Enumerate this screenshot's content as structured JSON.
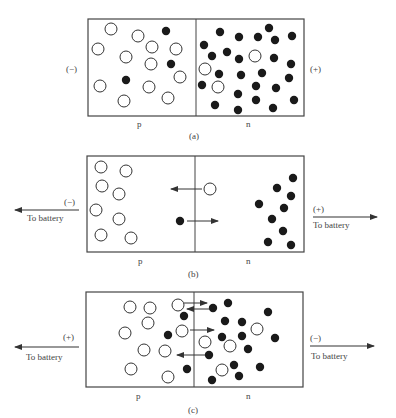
{
  "figure": {
    "colors": {
      "stroke": "#444444",
      "electron": "#1a1a1a",
      "hole_fill": "#ffffff"
    },
    "panels": [
      {
        "id": "a",
        "caption": "(a)",
        "left_region_label": "p",
        "right_region_label": "n",
        "left_terminal": "(−)",
        "right_terminal": "(+)",
        "left_battery_label": "",
        "right_battery_label": "",
        "box": {
          "x": 88,
          "y": 19,
          "w": 216,
          "h": 97,
          "divider_x": 196
        },
        "holes": [
          [
            111,
            29
          ],
          [
            138,
            36
          ],
          [
            98,
            49
          ],
          [
            126,
            57
          ],
          [
            152,
            47
          ],
          [
            176,
            49
          ],
          [
            151,
            64
          ],
          [
            180,
            77
          ],
          [
            100,
            86
          ],
          [
            149,
            87
          ],
          [
            124,
            101
          ],
          [
            168,
            98
          ],
          [
            255,
            56
          ],
          [
            205,
            69
          ],
          [
            218,
            87
          ]
        ],
        "electrons": [
          [
            166,
            31
          ],
          [
            171,
            64
          ],
          [
            126,
            80
          ],
          [
            220,
            32
          ],
          [
            239,
            37
          ],
          [
            258,
            37
          ],
          [
            269,
            28
          ],
          [
            275,
            40
          ],
          [
            292,
            36
          ],
          [
            204,
            45
          ],
          [
            212,
            56
          ],
          [
            227,
            52
          ],
          [
            239,
            59
          ],
          [
            274,
            58
          ],
          [
            291,
            64
          ],
          [
            219,
            74
          ],
          [
            241,
            75
          ],
          [
            262,
            73
          ],
          [
            289,
            78
          ],
          [
            202,
            85
          ],
          [
            256,
            86
          ],
          [
            276,
            88
          ],
          [
            238,
            94
          ],
          [
            256,
            100
          ],
          [
            294,
            100
          ],
          [
            215,
            105
          ],
          [
            238,
            110
          ],
          [
            273,
            108
          ]
        ],
        "arrows": [],
        "battery_arrows": []
      },
      {
        "id": "b",
        "caption": "(b)",
        "left_region_label": "p",
        "right_region_label": "n",
        "left_terminal": "(−)",
        "right_terminal": "(+)",
        "left_battery_label": "To battery",
        "right_battery_label": "To battery",
        "box": {
          "x": 87,
          "y": 156,
          "w": 217,
          "h": 96,
          "divider_x": 195
        },
        "holes": [
          [
            101,
            167
          ],
          [
            126,
            171
          ],
          [
            102,
            186
          ],
          [
            119,
            194
          ],
          [
            96,
            210
          ],
          [
            119,
            219
          ],
          [
            101,
            235
          ],
          [
            131,
            238
          ],
          [
            210,
            189
          ]
        ],
        "electrons": [
          [
            180,
            221
          ],
          [
            293,
            178
          ],
          [
            277,
            188
          ],
          [
            291,
            196
          ],
          [
            259,
            204
          ],
          [
            284,
            208
          ],
          [
            272,
            219
          ],
          [
            283,
            231
          ],
          [
            268,
            242
          ],
          [
            291,
            245
          ]
        ],
        "arrows": [
          [
            202,
            189,
            171,
            189
          ],
          [
            187,
            221,
            218,
            221
          ]
        ],
        "battery_arrows": [
          [
            79,
            210,
            15,
            210
          ],
          [
            313,
            217,
            377,
            217
          ]
        ]
      },
      {
        "id": "c",
        "caption": "(c)",
        "left_region_label": "p",
        "right_region_label": "n",
        "left_terminal": "(+)",
        "right_terminal": "(−)",
        "left_battery_label": "To battery",
        "right_battery_label": "To battery",
        "box": {
          "x": 86,
          "y": 292,
          "w": 217,
          "h": 95,
          "divider_x": 194
        },
        "holes": [
          [
            130,
            307
          ],
          [
            150,
            308
          ],
          [
            178,
            305
          ],
          [
            148,
            323
          ],
          [
            125,
            333
          ],
          [
            182,
            331
          ],
          [
            144,
            350
          ],
          [
            165,
            351
          ],
          [
            131,
            369
          ],
          [
            168,
            377
          ],
          [
            257,
            329
          ],
          [
            205,
            342
          ],
          [
            230,
            346
          ],
          [
            222,
            370
          ]
        ],
        "electrons": [
          [
            184,
            316
          ],
          [
            168,
            335
          ],
          [
            187,
            369
          ],
          [
            213,
            308
          ],
          [
            228,
            303
          ],
          [
            268,
            312
          ],
          [
            225,
            321
          ],
          [
            242,
            322
          ],
          [
            222,
            337
          ],
          [
            242,
            336
          ],
          [
            275,
            338
          ],
          [
            248,
            349
          ],
          [
            209,
            355
          ],
          [
            234,
            365
          ],
          [
            260,
            367
          ],
          [
            239,
            376
          ],
          [
            212,
            380
          ]
        ],
        "arrows": [
          [
            184,
            303,
            207,
            303
          ],
          [
            210,
            309,
            187,
            309
          ],
          [
            190,
            330,
            214,
            330
          ],
          [
            205,
            355,
            177,
            355
          ]
        ],
        "battery_arrows": [
          [
            79,
            347,
            15,
            347
          ],
          [
            310,
            346,
            374,
            346
          ]
        ]
      }
    ]
  }
}
